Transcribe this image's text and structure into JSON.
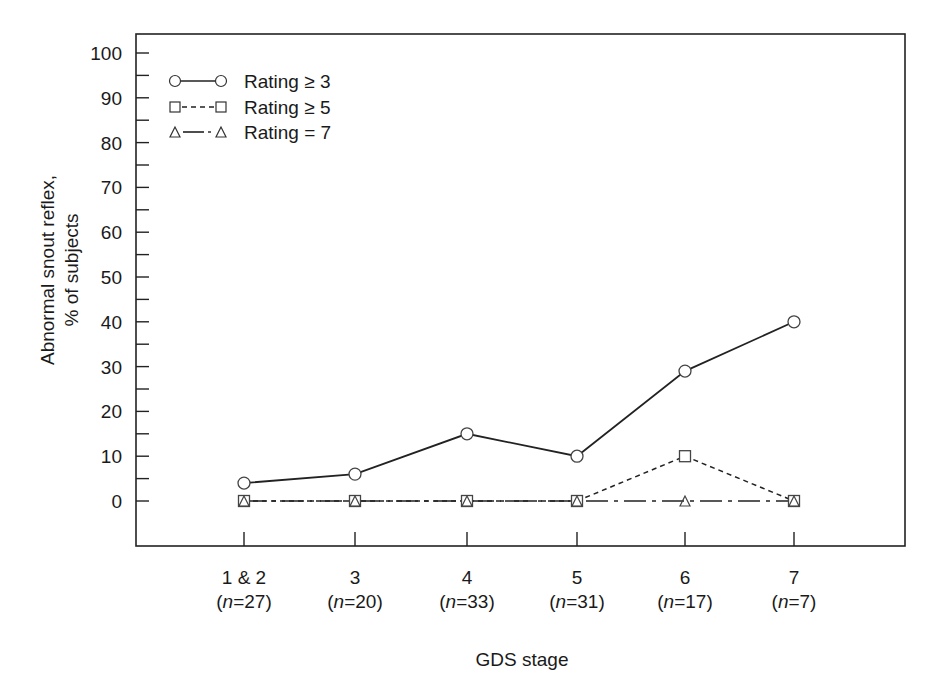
{
  "chart_data": {
    "type": "line",
    "title": "",
    "xlabel": "GDS stage",
    "ylabel_lines": [
      "Abnormal snout reflex,",
      "% of subjects"
    ],
    "ylabel": "Abnormal snout reflex, % of subjects",
    "ylim": [
      -10,
      100
    ],
    "yticks": [
      0,
      10,
      20,
      30,
      40,
      50,
      60,
      70,
      80,
      90,
      100
    ],
    "yminor_step": 5,
    "grid": false,
    "legend_position": "upper left",
    "categories": [
      "1 & 2",
      "3",
      "4",
      "5",
      "6",
      "7"
    ],
    "category_n": [
      "(n=27)",
      "(n=20)",
      "(n=33)",
      "(n=31)",
      "(n=17)",
      "(n=7)"
    ],
    "category_n_values": [
      27,
      20,
      33,
      31,
      17,
      7
    ],
    "series": [
      {
        "name": "Rating ≥ 3",
        "marker": "circle",
        "line": "solid",
        "values": [
          4,
          6,
          15,
          10,
          29,
          40
        ]
      },
      {
        "name": "Rating ≥ 5",
        "marker": "square",
        "line": "dashed",
        "values": [
          0,
          0,
          0,
          0,
          10,
          0
        ]
      },
      {
        "name": "Rating = 7",
        "marker": "triangle",
        "line": "dashdot",
        "values": [
          0,
          0,
          0,
          0,
          0,
          0
        ]
      }
    ]
  },
  "legend": {
    "items": [
      {
        "label": "Rating ≥ 3"
      },
      {
        "label": "Rating ≥ 5"
      },
      {
        "label": "Rating = 7"
      }
    ]
  },
  "axes": {
    "x_title": "GDS stage",
    "y_title_line1": "Abnormal snout reflex,",
    "y_title_line2": "% of subjects"
  }
}
